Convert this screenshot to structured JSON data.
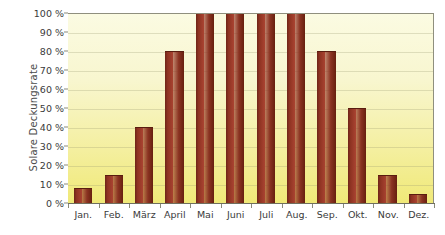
{
  "chart_data": {
    "type": "bar",
    "title": "",
    "subtitle": "",
    "xlabel": "",
    "ylabel": "Solare Deckungsrate",
    "categories": [
      "Jan.",
      "Feb.",
      "März",
      "April",
      "Mai",
      "Juni",
      "Juli",
      "Aug.",
      "Sep.",
      "Okt.",
      "Nov.",
      "Dez."
    ],
    "values": [
      8,
      15,
      40,
      80,
      100,
      100,
      100,
      100,
      80,
      50,
      15,
      5
    ],
    "ylim": [
      0,
      100
    ],
    "ytick_values": [
      0,
      10,
      20,
      30,
      40,
      50,
      60,
      70,
      80,
      90,
      100
    ],
    "ytick_labels": [
      "0 %",
      "10 %",
      "20 %",
      "30 %",
      "40 %",
      "50 %",
      "60 %",
      "70 %",
      "80 %",
      "90 %",
      "100 %"
    ],
    "grid": true,
    "legend": false,
    "legend_position": "none",
    "bar_color": "#8b3322",
    "plot_background_top": "#fbfbe2",
    "plot_background_bottom": "#f0e978",
    "axis_color": "#6f6f5f",
    "text_color": "#3a3a3a"
  }
}
